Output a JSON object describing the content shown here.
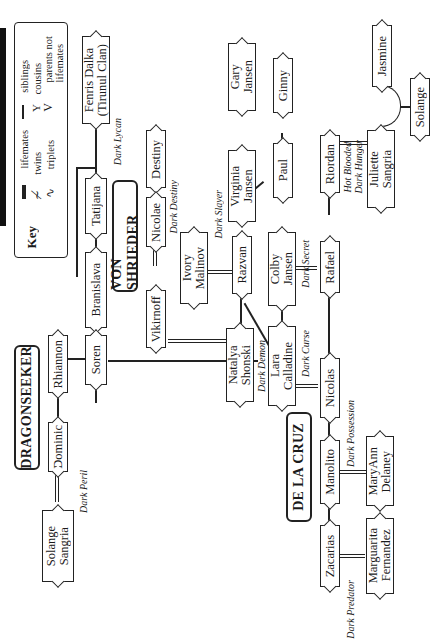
{
  "key": {
    "title": "Key",
    "items": [
      {
        "symbol": "lifemates-line",
        "label": "lifemates"
      },
      {
        "symbol": "twins-line",
        "label": "twins"
      },
      {
        "symbol": "triplets-line",
        "label": "triplets"
      },
      {
        "symbol": "siblings-line",
        "label": "siblings"
      },
      {
        "symbol": "cousins-fork",
        "label": "cousins"
      },
      {
        "symbol": "parents-v",
        "label": "parents not\nlifemates"
      }
    ]
  },
  "clans": [
    {
      "id": "dragonseeker",
      "name": "DRAGONSEEKER"
    },
    {
      "id": "vonshrieder",
      "name": "VON SHRIEDER"
    },
    {
      "id": "delacruz",
      "name": "DE LA CRUZ"
    }
  ],
  "people": {
    "fenris": "Fenris Dalka\n(Tirunul Clan)",
    "tatijana": "Tatijana",
    "bransilava": "Branislava",
    "soren": "Soren",
    "rhiannon": "Rhiannon",
    "dominic": "Dominic",
    "solange_s": "Solange\nSangria",
    "destiny": "Destiny",
    "nicolae": "Nicolae",
    "vikirnoff": "Vikirnoff",
    "natalya": "Natalya\nShonski",
    "ivory": "Ivory\nMalinov",
    "razvan": "Razvan",
    "gary": "Gary\nJansen",
    "virginia": "Virginia\nJansen",
    "ginny": "Ginny",
    "paul": "Paul",
    "colby": "Colby\nJansen",
    "lara": "Lara\nCalladine",
    "rafael": "Rafael",
    "riordan": "Riordan",
    "juliette": "Juliette\nSangria",
    "jasmine": "Jasmine",
    "solange": "Solange",
    "nicolas": "Nicolas",
    "manolito": "Manolito",
    "maryann": "MaryAnn\nDelaney",
    "zacarias": "Zacarias",
    "marguarita": "Marguarita\nFernandez"
  },
  "books": {
    "dark_lycan": "Dark Lycan",
    "dark_destiny": "Dark Destiny",
    "dark_slayer": "Dark Slayer",
    "dark_demon": "Dark Demon",
    "dark_curse": "Dark Curse",
    "dark_secret": "Dark Secret",
    "hot_blooded": "Hot Blooded\nDark Hunger",
    "dark_possession": "Dark Possession",
    "dark_predator": "Dark Predator",
    "dark_peril": "Dark Peril"
  }
}
